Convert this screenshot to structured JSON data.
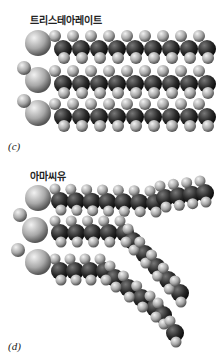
{
  "panel_c": {
    "title": "트리스테아레이트",
    "label": "(c)"
  },
  "panel_d": {
    "title": "아마씨유",
    "label": "(d)"
  },
  "colors": {
    "carbon": "#2a2a2a",
    "hydrogen": "#b8b8b8",
    "oxygen": "#a0a0a0",
    "bond_highlight": "#d8d8d8"
  }
}
